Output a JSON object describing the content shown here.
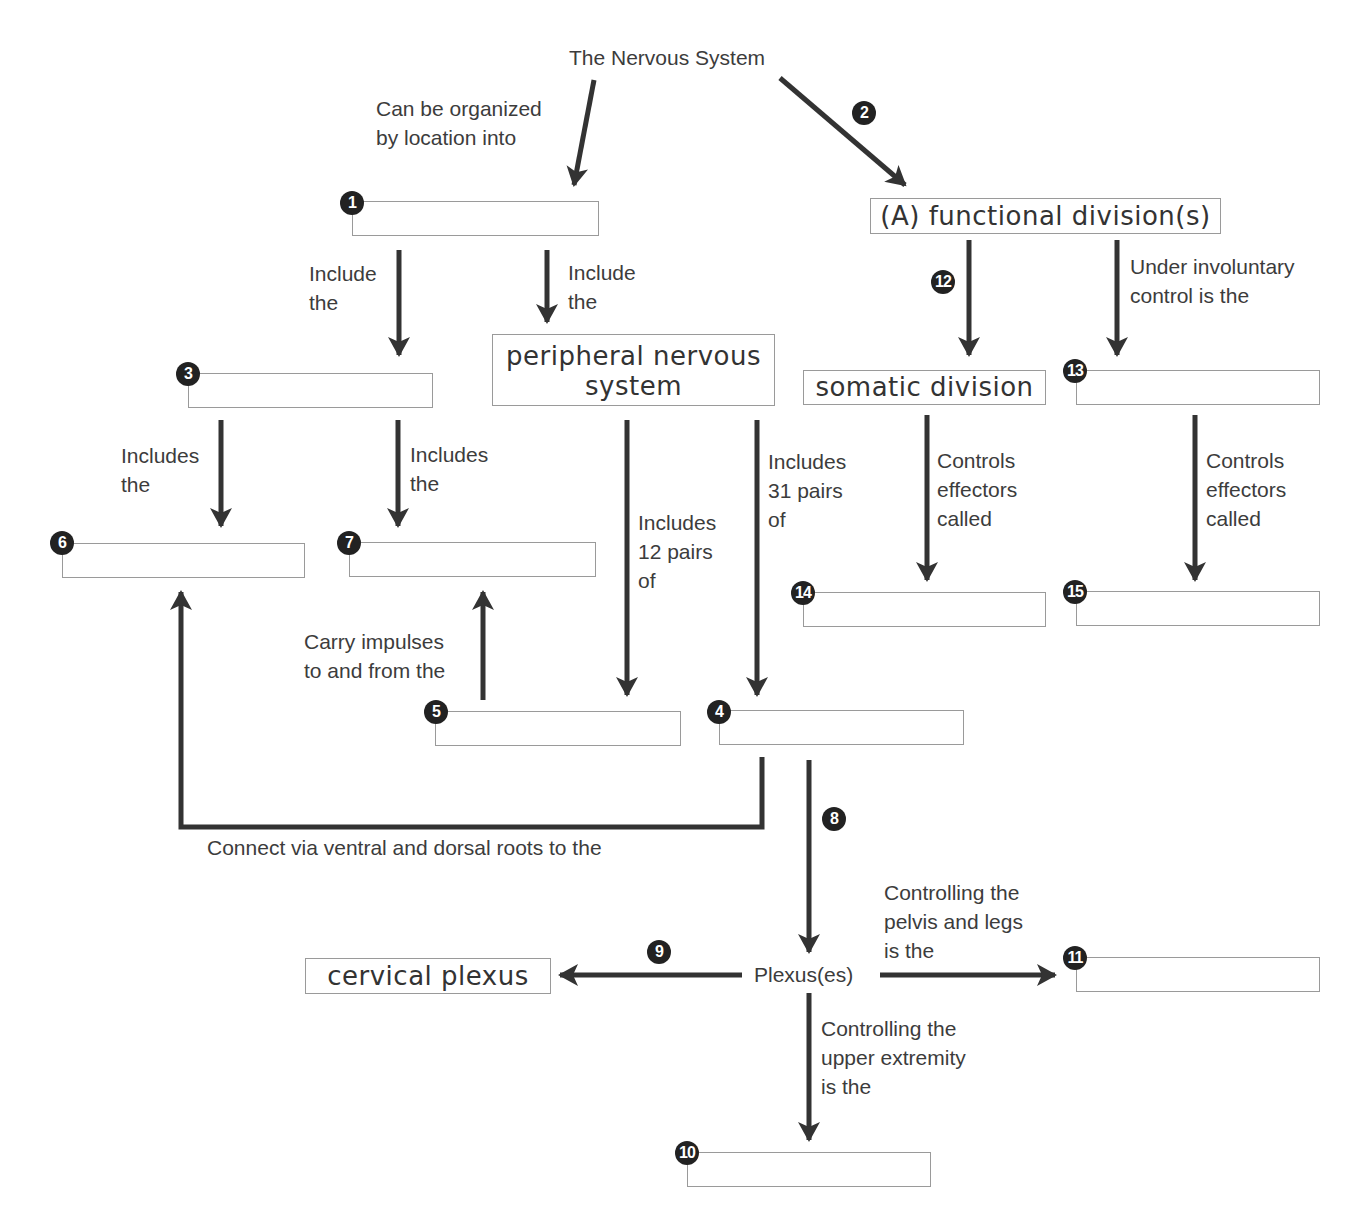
{
  "diagram": {
    "root": "The Nervous System",
    "filled_boxes": {
      "functional": "(A) functional division(s)",
      "pns_line1": "peripheral nervous",
      "pns_line2": "system",
      "somatic": "somatic division",
      "cervical": "cervical plexus"
    },
    "center_node": "Plexus(es)",
    "labels": {
      "organized_1": "Can be organized",
      "organized_2": "by location into",
      "include_left_1": "Include",
      "include_left_2": "the",
      "include_right_1": "Include",
      "include_right_2": "the",
      "includes6_1": "Includes",
      "includes6_2": "the",
      "includes7_1": "Includes",
      "includes7_2": "the",
      "pairs12_1": "Includes",
      "pairs12_2": "12 pairs",
      "pairs12_3": "of",
      "pairs31_1": "Includes",
      "pairs31_2": "31 pairs",
      "pairs31_3": "of",
      "involuntary_1": "Under involuntary",
      "involuntary_2": "control is the",
      "effectors14_1": "Controls",
      "effectors14_2": "effectors",
      "effectors14_3": "called",
      "effectors15_1": "Controls",
      "effectors15_2": "effectors",
      "effectors15_3": "called",
      "carry_1": "Carry impulses",
      "carry_2": "to and from the",
      "connect": "Connect via ventral and dorsal roots to the",
      "pelvis_1": "Controlling the",
      "pelvis_2": "pelvis and legs",
      "pelvis_3": "is the",
      "upper_1": "Controlling the",
      "upper_2": "upper extremity",
      "upper_3": "is the"
    },
    "blank_numbers": {
      "n1": "1",
      "n2": "2",
      "n3": "3",
      "n4": "4",
      "n5": "5",
      "n6": "6",
      "n7": "7",
      "n8": "8",
      "n9": "9",
      "n10": "10",
      "n11": "11",
      "n12": "12",
      "n13": "13",
      "n14": "14",
      "n15": "15"
    },
    "colors": {
      "arrow": "#333333",
      "box_border": "#9a9a9a",
      "badge": "#222222"
    }
  }
}
